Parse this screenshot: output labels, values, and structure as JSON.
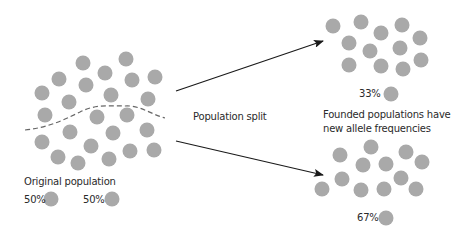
{
  "diagram": {
    "colors": {
      "dot": "#a9a9a9",
      "text": "#2a2a2a",
      "arrow": "#1a1a1a",
      "dash": "#666666",
      "background": "#ffffff"
    },
    "dot_radius": 7.5,
    "original_population": {
      "label": "Original population",
      "dots": [
        [
          83,
          63
        ],
        [
          126,
          59
        ],
        [
          59,
          79
        ],
        [
          105,
          73
        ],
        [
          86,
          85
        ],
        [
          132,
          80
        ],
        [
          155,
          77
        ],
        [
          42,
          93
        ],
        [
          69,
          102
        ],
        [
          111,
          95
        ],
        [
          148,
          99
        ],
        [
          45,
          115
        ],
        [
          97,
          117
        ],
        [
          127,
          115
        ],
        [
          70,
          132
        ],
        [
          113,
          133
        ],
        [
          147,
          130
        ],
        [
          42,
          142
        ],
        [
          91,
          146
        ],
        [
          58,
          157
        ],
        [
          130,
          151
        ],
        [
          154,
          150
        ],
        [
          78,
          163
        ],
        [
          109,
          159
        ]
      ],
      "divider": "dashed-curve",
      "legend": [
        {
          "percent": "50%",
          "allele": "A"
        },
        {
          "percent": "50%",
          "allele": "B"
        }
      ]
    },
    "split_label": "Population split",
    "founded_label_line1": "Founded populations have",
    "founded_label_line2": "new allele frequencies",
    "founded_populations": [
      {
        "name": "upper",
        "percent": "33%",
        "dots": [
          [
            333,
            26
          ],
          [
            361,
            22
          ],
          [
            381,
            33
          ],
          [
            402,
            25
          ],
          [
            420,
            38
          ],
          [
            349,
            43
          ],
          [
            370,
            51
          ],
          [
            400,
            48
          ],
          [
            349,
            65
          ],
          [
            381,
            66
          ],
          [
            403,
            69
          ],
          [
            421,
            60
          ]
        ]
      },
      {
        "name": "lower",
        "percent": "67%",
        "dots": [
          [
            340,
            155
          ],
          [
            371,
            147
          ],
          [
            406,
            152
          ],
          [
            363,
            165
          ],
          [
            386,
            164
          ],
          [
            422,
            162
          ],
          [
            342,
            179
          ],
          [
            401,
            178
          ],
          [
            322,
            189
          ],
          [
            361,
            190
          ],
          [
            384,
            189
          ],
          [
            416,
            189
          ]
        ]
      }
    ],
    "arrows": [
      {
        "name": "upper-arrow",
        "from": [
          176,
          91
        ],
        "to": [
          323,
          41
        ]
      },
      {
        "name": "lower-arrow",
        "from": [
          176,
          141
        ],
        "to": [
          323,
          175
        ]
      }
    ]
  }
}
